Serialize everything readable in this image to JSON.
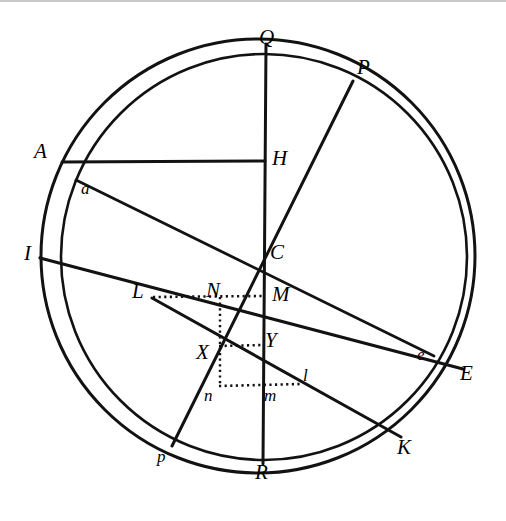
{
  "figure": {
    "canvas": {
      "width": 506,
      "height": 521
    },
    "ink_color": "#121212",
    "paper_color": "#ffffff",
    "edge_rule_color": "#c9c9c9"
  },
  "circles": [
    {
      "name": "outer-circle",
      "cx": 258,
      "cy": 256,
      "r": 217,
      "stroke_width": 3.0
    },
    {
      "name": "inner-circle",
      "cx": 264,
      "cy": 257,
      "r": 203,
      "stroke_width": 2.6
    }
  ],
  "lines": [
    {
      "name": "line-Q-R",
      "from": "Q",
      "to": "R",
      "x1": 266,
      "y1": 44,
      "x2": 263,
      "y2": 464,
      "width": 3.0,
      "style": "solid"
    },
    {
      "name": "line-P-p",
      "from": "P",
      "to": "p",
      "x1": 353,
      "y1": 81,
      "x2": 172,
      "y2": 446,
      "width": 3.0,
      "style": "solid"
    },
    {
      "name": "line-I-E",
      "from": "I",
      "to": "E",
      "x1": 40,
      "y1": 258,
      "x2": 463,
      "y2": 369,
      "width": 3.2,
      "style": "solid"
    },
    {
      "name": "line-A-H",
      "from": "A",
      "to": "H",
      "x1": 62,
      "y1": 162,
      "x2": 265,
      "y2": 161,
      "width": 3.0,
      "style": "solid"
    },
    {
      "name": "line-a-e",
      "from": "a",
      "to": "e",
      "x1": 76,
      "y1": 180,
      "x2": 434,
      "y2": 356,
      "width": 2.8,
      "style": "solid"
    },
    {
      "name": "line-L-K",
      "from": "L",
      "to": "K",
      "x1": 152,
      "y1": 298,
      "x2": 401,
      "y2": 437,
      "width": 3.0,
      "style": "solid"
    }
  ],
  "dotted_lines": [
    {
      "name": "dotted-L-N-M",
      "x1": 153,
      "y1": 297,
      "x2": 263,
      "y2": 296
    },
    {
      "name": "dotted-X-Y",
      "x1": 219,
      "y1": 346,
      "x2": 263,
      "y2": 345
    },
    {
      "name": "dotted-n-m-l",
      "x1": 219,
      "y1": 386,
      "x2": 301,
      "y2": 384
    },
    {
      "name": "dotted-N-X-n",
      "x1": 220,
      "y1": 297,
      "x2": 220,
      "y2": 387
    }
  ],
  "labels": [
    {
      "name": "label-Q",
      "text": "Q",
      "x": 259,
      "y": 27,
      "size": "major"
    },
    {
      "name": "label-P",
      "text": "P",
      "x": 357,
      "y": 57,
      "size": "major"
    },
    {
      "name": "label-A",
      "text": "A",
      "x": 34,
      "y": 141,
      "size": "major"
    },
    {
      "name": "label-H",
      "text": "H",
      "x": 272,
      "y": 148,
      "size": "major"
    },
    {
      "name": "label-a",
      "text": "a",
      "x": 81,
      "y": 180,
      "size": "minor"
    },
    {
      "name": "label-I",
      "text": "I",
      "x": 24,
      "y": 243,
      "size": "major"
    },
    {
      "name": "label-C",
      "text": "C",
      "x": 270,
      "y": 242,
      "size": "major"
    },
    {
      "name": "label-L",
      "text": "L",
      "x": 132,
      "y": 281,
      "size": "major"
    },
    {
      "name": "label-N",
      "text": "N",
      "x": 206,
      "y": 280,
      "size": "major"
    },
    {
      "name": "label-M",
      "text": "M",
      "x": 272,
      "y": 284,
      "size": "major"
    },
    {
      "name": "label-Y",
      "text": "Y",
      "x": 265,
      "y": 330,
      "size": "major"
    },
    {
      "name": "label-X",
      "text": "X",
      "x": 196,
      "y": 342,
      "size": "major"
    },
    {
      "name": "label-e",
      "text": "e",
      "x": 417,
      "y": 346,
      "size": "minor"
    },
    {
      "name": "label-E",
      "text": "E",
      "x": 460,
      "y": 363,
      "size": "major"
    },
    {
      "name": "label-l",
      "text": "l",
      "x": 303,
      "y": 367,
      "size": "minor"
    },
    {
      "name": "label-n",
      "text": "n",
      "x": 204,
      "y": 387,
      "size": "minor"
    },
    {
      "name": "label-m",
      "text": "m",
      "x": 264,
      "y": 387,
      "size": "minor"
    },
    {
      "name": "label-K",
      "text": "K",
      "x": 397,
      "y": 437,
      "size": "major"
    },
    {
      "name": "label-p",
      "text": "p",
      "x": 157,
      "y": 448,
      "size": "minor"
    },
    {
      "name": "label-R",
      "text": "R",
      "x": 255,
      "y": 462,
      "size": "major"
    }
  ]
}
